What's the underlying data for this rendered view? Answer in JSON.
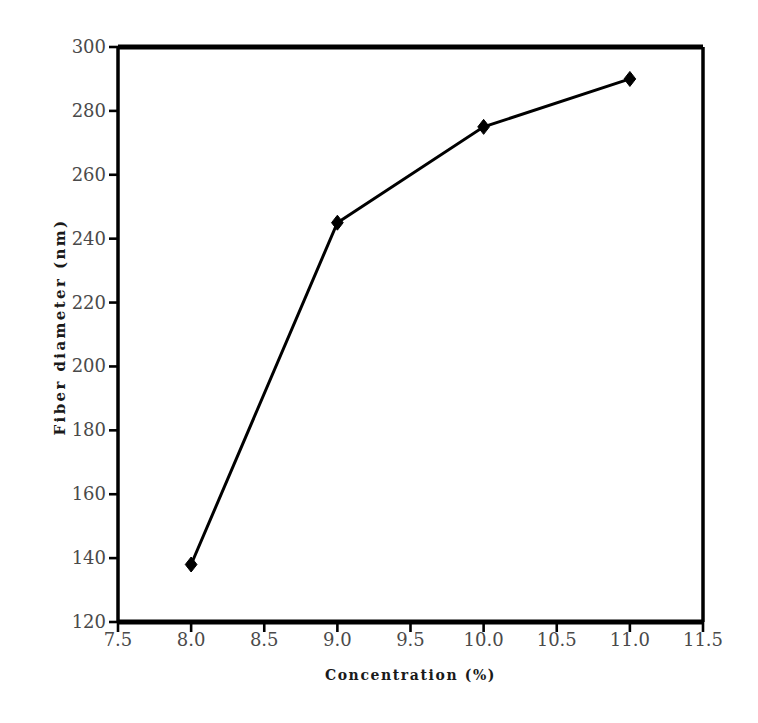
{
  "chart_data": {
    "type": "line",
    "title": "",
    "xlabel": "Concentration (%)",
    "ylabel": "Fiber diameter (nm)",
    "x": [
      8.0,
      9.0,
      10.0,
      11.0
    ],
    "values": [
      138,
      245,
      275,
      290
    ],
    "series": [
      {
        "name": "Fiber diameter",
        "x": [
          8.0,
          9.0,
          10.0,
          11.0
        ],
        "values": [
          138,
          245,
          275,
          290
        ],
        "marker": "diamond",
        "color": "#000000",
        "line_width": 3
      }
    ],
    "xlim": [
      7.5,
      11.5
    ],
    "ylim": [
      120,
      300
    ],
    "xticks": [
      7.5,
      8.0,
      8.5,
      9.0,
      9.5,
      10.0,
      10.5,
      11.0,
      11.5
    ],
    "xtick_labels": [
      "7.5",
      "8.0",
      "8.5",
      "9.0",
      "9.5",
      "10.0",
      "10.5",
      "11.0",
      "11.5"
    ],
    "yticks": [
      120,
      140,
      160,
      180,
      200,
      220,
      240,
      260,
      280,
      300
    ],
    "ytick_labels": [
      "120",
      "140",
      "160",
      "180",
      "200",
      "220",
      "240",
      "260",
      "280",
      "300"
    ],
    "grid": false,
    "legend": null,
    "legend_position": "none",
    "axis_color": "#000000",
    "tick_label_color": "#4a4a4a",
    "background_color": "#ffffff",
    "frame": "box"
  }
}
